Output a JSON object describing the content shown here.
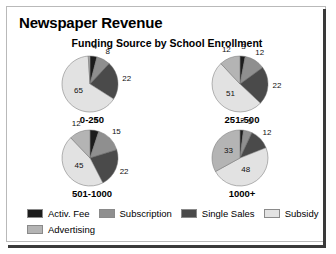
{
  "chart_data": {
    "type": "pie",
    "title": "Newspaper Revenue",
    "subtitle": "Funding Source by School Enrollment",
    "legend_position": "bottom",
    "categories": [
      "Activ. Fee",
      "Subscription",
      "Single Sales",
      "Subsidy",
      "Advertising"
    ],
    "colors": [
      "#1c1c1c",
      "#8f8f8f",
      "#4a4a4a",
      "#e2e2e2",
      "#b4b4b4"
    ],
    "groups": [
      {
        "name": "0-250",
        "values": [
          4,
          8,
          22,
          65,
          1
        ],
        "labels": [
          "4",
          "8",
          "22",
          "65",
          ""
        ]
      },
      {
        "name": "251-500",
        "values": [
          3,
          12,
          22,
          51,
          12
        ],
        "labels": [
          "3",
          "12",
          "22",
          "51",
          "12"
        ]
      },
      {
        "name": "501-1000",
        "values": [
          5,
          15,
          22,
          45,
          12
        ],
        "labels": [
          "5",
          "15",
          "22",
          "45",
          "12"
        ]
      },
      {
        "name": "1000+",
        "values": [
          2,
          5,
          12,
          48,
          33
        ],
        "labels": [
          "2",
          "5",
          "12",
          "48",
          "33"
        ]
      }
    ]
  },
  "header": {
    "title": "Newspaper Revenue",
    "subtitle": "Funding Source by School Enrollment"
  },
  "panels": [
    {
      "label": "0-250",
      "slices": [
        {
          "name": "Activ. Fee",
          "value": 4,
          "label": "4"
        },
        {
          "name": "Subscription",
          "value": 8,
          "label": "8"
        },
        {
          "name": "Single Sales",
          "value": 22,
          "label": "22"
        },
        {
          "name": "Subsidy",
          "value": 65,
          "label": "65"
        },
        {
          "name": "Advertising",
          "value": 1,
          "label": ""
        }
      ]
    },
    {
      "label": "251-500",
      "slices": [
        {
          "name": "Activ. Fee",
          "value": 3,
          "label": "3"
        },
        {
          "name": "Subscription",
          "value": 12,
          "label": "12"
        },
        {
          "name": "Single Sales",
          "value": 22,
          "label": "22"
        },
        {
          "name": "Subsidy",
          "value": 51,
          "label": "51"
        },
        {
          "name": "Advertising",
          "value": 12,
          "label": "12"
        }
      ]
    },
    {
      "label": "501-1000",
      "slices": [
        {
          "name": "Activ. Fee",
          "value": 5,
          "label": "5"
        },
        {
          "name": "Subscription",
          "value": 15,
          "label": "15"
        },
        {
          "name": "Single Sales",
          "value": 22,
          "label": "22"
        },
        {
          "name": "Subsidy",
          "value": 45,
          "label": "45"
        },
        {
          "name": "Advertising",
          "value": 12,
          "label": "12"
        }
      ]
    },
    {
      "label": "1000+",
      "slices": [
        {
          "name": "Activ. Fee",
          "value": 2,
          "label": "2"
        },
        {
          "name": "Subscription",
          "value": 5,
          "label": "5"
        },
        {
          "name": "Single Sales",
          "value": 12,
          "label": "12"
        },
        {
          "name": "Subsidy",
          "value": 48,
          "label": "48"
        },
        {
          "name": "Advertising",
          "value": 33,
          "label": "33"
        }
      ]
    }
  ],
  "legend": {
    "items": [
      {
        "label": "Activ. Fee",
        "color": "#1c1c1c"
      },
      {
        "label": "Subscription",
        "color": "#8f8f8f"
      },
      {
        "label": "Single Sales",
        "color": "#4a4a4a"
      },
      {
        "label": "Subsidy",
        "color": "#e2e2e2"
      },
      {
        "label": "Advertising",
        "color": "#b4b4b4"
      }
    ]
  }
}
